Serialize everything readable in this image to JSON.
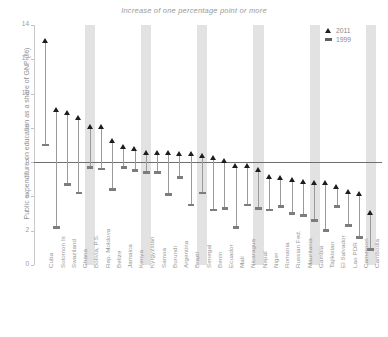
{
  "chart": {
    "title": "Increase of  one percentage point or more",
    "ylabel": "Public expenditure on education as a share of GNP (%)"
  },
  "legend": {
    "position": "top-right",
    "entries": [
      {
        "label": "2011",
        "marker": "triangle-up-icon",
        "color": "#1d1d1d"
      },
      {
        "label": "1999",
        "marker": "dash-icon",
        "color": "#5f5f5f"
      }
    ]
  },
  "axis": {
    "yticks": [
      "0",
      "2",
      "4",
      "6",
      "8",
      "10",
      "12",
      "14"
    ],
    "ymin": 0,
    "ymax": 14,
    "reference_value": 6
  },
  "chart_data": {
    "type": "scatter",
    "title": "Increase of  one percentage point or more",
    "xlabel": "",
    "ylabel": "Public expenditure on education as a share of GNP (%)",
    "ylim": [
      0,
      14
    ],
    "yticks": [
      0,
      2,
      4,
      6,
      8,
      10,
      12,
      14
    ],
    "grid": false,
    "reference_line": 6,
    "legend_position": "top-right",
    "categories": [
      "Cuba",
      "Solomon Is",
      "Swaziland",
      "Ghana",
      "Bolivia, P.S.",
      "Rep. Moldova",
      "Belize",
      "Jamaica",
      "Kenya",
      "Kyrgyzstan",
      "Samoa",
      "Burundi",
      "Argentina",
      "Brazil",
      "Senegal",
      "Benin",
      "Ecuador",
      "Mali",
      "Nicaragua",
      "Nepal",
      "Niger",
      "Romania",
      "Russian Fed.",
      "Mauritania",
      "Gambia",
      "Tajikistan",
      "El Salvador",
      "Lao PDR",
      "Cameroon",
      "Cambodia"
    ],
    "series": [
      {
        "name": "2011",
        "marker": "triangle",
        "color": "#1d1d1d",
        "values": [
          13.0,
          9.0,
          8.8,
          8.5,
          8.0,
          8.0,
          7.2,
          6.8,
          6.7,
          6.5,
          6.5,
          6.5,
          6.4,
          6.4,
          6.3,
          6.2,
          6.0,
          5.7,
          5.7,
          5.5,
          5.1,
          5.0,
          4.9,
          4.8,
          4.7,
          4.7,
          4.5,
          4.2,
          4.1,
          3.0
        ]
      },
      {
        "name": "1999",
        "marker": "dash",
        "color": "#7d7d7d",
        "values": [
          7.0,
          2.2,
          4.7,
          4.2,
          5.7,
          5.6,
          4.4,
          5.7,
          5.5,
          5.4,
          5.4,
          4.1,
          5.1,
          3.5,
          4.2,
          3.2,
          3.3,
          2.2,
          3.5,
          3.3,
          3.2,
          3.4,
          3.0,
          2.9,
          2.6,
          2.0,
          3.4,
          2.3,
          1.6,
          0.9
        ]
      }
    ]
  }
}
